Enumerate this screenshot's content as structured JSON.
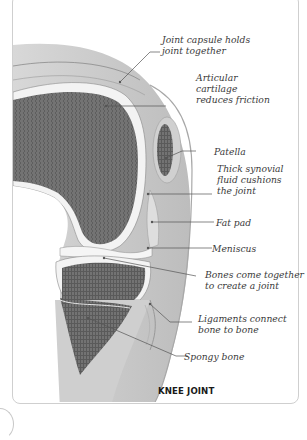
{
  "diagram": {
    "title": "KNEE JOINT",
    "labels": [
      {
        "id": "joint-capsule",
        "text": "Joint capsule holds\njoint together"
      },
      {
        "id": "articular-cartilage",
        "text": "Articular\ncartilage\nreduces friction"
      },
      {
        "id": "patella",
        "text": "Patella"
      },
      {
        "id": "synovial-fluid",
        "text": "Thick synovial\nfluid cushions\nthe joint"
      },
      {
        "id": "fat-pad",
        "text": "Fat pad"
      },
      {
        "id": "meniscus",
        "text": "Meniscus"
      },
      {
        "id": "bones",
        "text": "Bones come together\nto create a joint"
      },
      {
        "id": "ligaments",
        "text": "Ligaments connect\nbone to bone"
      },
      {
        "id": "spongy-bone",
        "text": "Spongy bone"
      }
    ],
    "colors": {
      "bone": "#6e6e6e",
      "cartilage": "#f2f2f2",
      "soft_tissue": "#c9c9c9",
      "label_text": "#3a3a3a",
      "leader_line": "#555555"
    }
  }
}
